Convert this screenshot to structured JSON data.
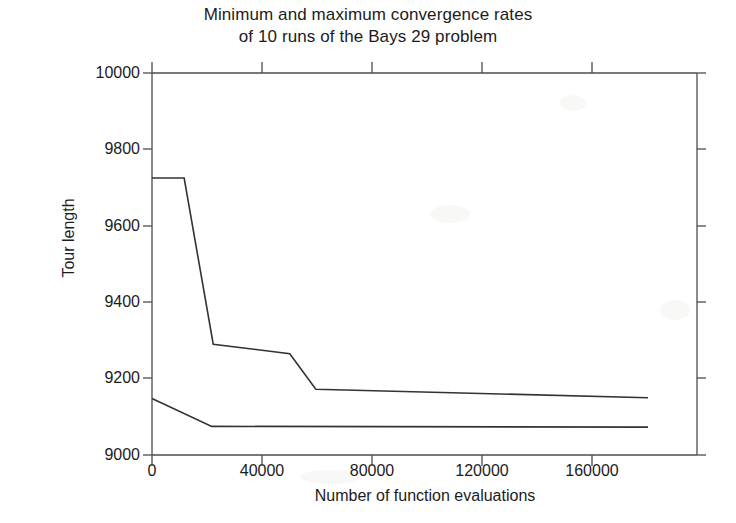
{
  "chart_data": {
    "type": "line",
    "title": "Minimum and maximum convergence rates of 10 runs of the Bays 29 problem",
    "title_line_1": "Minimum and maximum convergence rates",
    "title_line_2": "of 10 runs of the Bays 29 problem",
    "xlabel": "Number of function evaluations",
    "ylabel": "Tour length",
    "xlim": [
      0,
      178000
    ],
    "ylim": [
      9000,
      10000
    ],
    "xticks": [
      0,
      40000,
      80000,
      120000,
      160000
    ],
    "xtick_labels": [
      "0",
      "40000",
      "80000",
      "120000",
      "160000"
    ],
    "yticks": [
      9000,
      9200,
      9400,
      9600,
      9800,
      10000
    ],
    "ytick_labels": [
      "9000",
      "9200",
      "9400",
      "9600",
      "9800",
      "10000"
    ],
    "grid": false,
    "legend": null,
    "line_color": "#333333",
    "axis_color": "#4d4d4d",
    "series": [
      {
        "name": "maximum convergence rate",
        "x": [
          0,
          10500,
          20000,
          45000,
          53500,
          162000
        ],
        "values": [
          9725,
          9725,
          9290,
          9265,
          9172,
          9150
        ]
      },
      {
        "name": "minimum convergence rate",
        "x": [
          0,
          19500,
          162000
        ],
        "values": [
          9148,
          9075,
          9073
        ]
      }
    ]
  }
}
